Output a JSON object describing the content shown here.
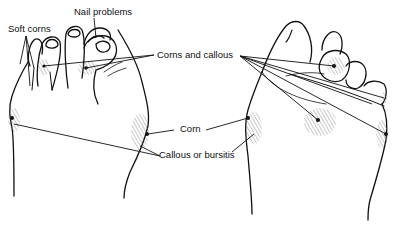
{
  "diagram": {
    "type": "medical-illustration",
    "colors": {
      "ink": "#111111",
      "hatch": "#555555",
      "background": "#ffffff"
    },
    "figures": [
      {
        "id": "left-foot",
        "view": "top (dorsal) view of foot, toes up"
      },
      {
        "id": "right-foot",
        "view": "sole (plantar) view of foot, toes up-right"
      }
    ],
    "labels": {
      "soft_corns": "Soft corns",
      "nail_problems": "Nail problems",
      "corns_and_callous": "Corns and callous",
      "corn": "Corn",
      "callous_or_bursitis": "Callous or bursitis"
    }
  }
}
